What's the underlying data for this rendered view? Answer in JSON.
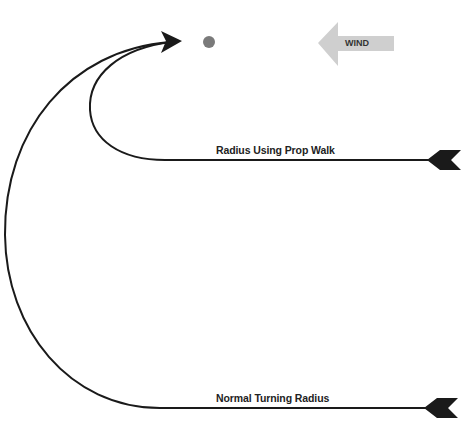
{
  "diagram": {
    "wind_label": "WIND",
    "paths": [
      {
        "label": "Radius Using Prop Walk",
        "type": "short-turn"
      },
      {
        "label": "Normal Turning Radius",
        "type": "wide-turn"
      }
    ],
    "colors": {
      "line": "#1a1a1a",
      "wind_arrow": "#cfcfcf",
      "target_dot": "#7a7a7a",
      "background": "#ffffff"
    },
    "icons": [
      "wind-arrow-icon",
      "target-dot-icon",
      "arrowhead-icon",
      "arrow-tail-fletching-icon"
    ]
  }
}
